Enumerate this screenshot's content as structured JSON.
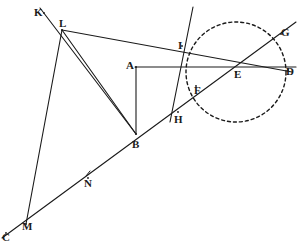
{
  "figure": {
    "canvas": {
      "width": 304,
      "height": 245,
      "background": "#ffffff"
    },
    "stroke_color": "#1a1a1a",
    "points": [
      {
        "id": "K",
        "label": "K",
        "x": 44,
        "y": 13,
        "label_x": 34,
        "label_y": 7
      },
      {
        "id": "L",
        "label": "L",
        "x": 62,
        "y": 30,
        "label_x": 59,
        "label_y": 18
      },
      {
        "id": "A",
        "label": "A",
        "x": 136,
        "y": 67,
        "label_x": 126,
        "label_y": 60
      },
      {
        "id": "B",
        "label": "B",
        "x": 136,
        "y": 134,
        "label_x": 132,
        "label_y": 139
      },
      {
        "id": "C",
        "label": "C",
        "x": 6,
        "y": 233,
        "label_x": 2,
        "label_y": 232
      },
      {
        "id": "M",
        "label": "M",
        "x": 26,
        "y": 224,
        "label_x": 22,
        "label_y": 221
      },
      {
        "id": "N",
        "label": "N",
        "x": 88,
        "y": 178,
        "label_x": 84,
        "label_y": 178
      },
      {
        "id": "H",
        "label": "H",
        "x": 178,
        "y": 112,
        "label_x": 174,
        "label_y": 114
      },
      {
        "id": "F",
        "label": "F",
        "x": 196,
        "y": 86,
        "label_x": 194,
        "label_y": 85
      },
      {
        "id": "I",
        "label": "I",
        "x": 182,
        "y": 46,
        "label_x": 178,
        "label_y": 40
      },
      {
        "id": "E",
        "label": "E",
        "x": 236,
        "y": 72,
        "label_x": 234,
        "label_y": 69
      },
      {
        "id": "D",
        "label": "D",
        "x": 288,
        "y": 70,
        "label_x": 286,
        "label_y": 66
      },
      {
        "id": "G",
        "label": "G",
        "x": 281,
        "y": 34,
        "label_x": 281,
        "label_y": 27
      }
    ],
    "circle": {
      "name": "dashed-circle-at-E",
      "cx": 236,
      "cy": 72,
      "r": 50,
      "dash": "3 3"
    },
    "segments": [
      {
        "name": "segment-K-B",
        "x1": 40,
        "y1": 8,
        "x2": 136,
        "y2": 134
      },
      {
        "name": "segment-L-M",
        "x1": 62,
        "y1": 30,
        "x2": 26,
        "y2": 224
      },
      {
        "name": "segment-L-B",
        "x1": 62,
        "y1": 30,
        "x2": 136,
        "y2": 134
      },
      {
        "name": "segment-L-D",
        "x1": 62,
        "y1": 30,
        "x2": 292,
        "y2": 72
      },
      {
        "name": "segment-C-G",
        "x1": 2,
        "y1": 238,
        "x2": 296,
        "y2": 22
      },
      {
        "name": "segment-A-B",
        "x1": 136,
        "y1": 67,
        "x2": 136,
        "y2": 134
      },
      {
        "name": "segment-A-D",
        "x1": 135,
        "y1": 67,
        "x2": 296,
        "y2": 67
      },
      {
        "name": "segment-I-H",
        "x1": 193,
        "y1": 7,
        "x2": 170,
        "y2": 122
      }
    ],
    "tick_marks": [
      {
        "name": "tick-at-N",
        "x1": 86,
        "y1": 176,
        "x2": 90,
        "y2": 171
      }
    ]
  }
}
